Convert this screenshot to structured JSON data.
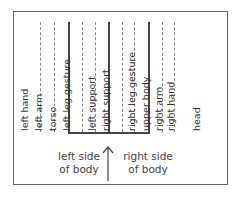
{
  "diagram": {
    "columns": [
      {
        "label": "left hand",
        "line": "dotted",
        "x": 40
      },
      {
        "label": "left arm",
        "line": "dotted",
        "x": 54
      },
      {
        "label": "torso",
        "line": "solid",
        "x": 68
      },
      {
        "label": "left leg gesture",
        "line": "dotted",
        "x": 82
      },
      {
        "label": "left support",
        "line": "dotted",
        "x": 94
      },
      {
        "label": "right support",
        "line": "solid",
        "x": 108
      },
      {
        "label": "right leg gesture",
        "line": "dotted",
        "x": 122
      },
      {
        "label": "upper body",
        "line": "dotted",
        "x": 133
      },
      {
        "label": "right arm",
        "line": "solid",
        "x": 148
      },
      {
        "label": "right hand",
        "line": "dotted",
        "x": 162
      },
      {
        "label": "head",
        "line": "dotted",
        "x": 174
      }
    ],
    "labels": {
      "left_hand": "left hand",
      "left_arm": "left arm",
      "torso": "torso",
      "left_leg_gesture": "left leg gesture",
      "left_support": "left support",
      "right_support": "right support",
      "right_leg_gesture": "right leg gesture",
      "upper_body": "upper body",
      "right_arm": "right arm",
      "right_hand": "right hand",
      "head": "head"
    },
    "captions": {
      "left_line1": "left side",
      "left_line2": "of body",
      "right_line1": "right side",
      "right_line2": "of body"
    },
    "colors": {
      "frame": "#666666",
      "solid_line": "#444444",
      "dotted_line": "#8a8a8a",
      "text": "#333333"
    }
  }
}
